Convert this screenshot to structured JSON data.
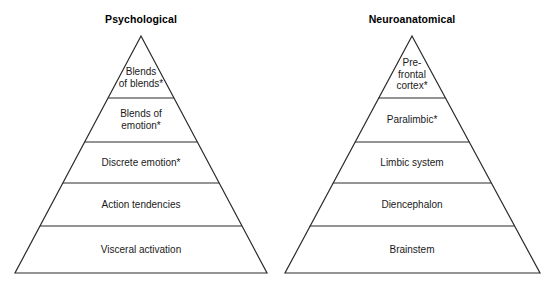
{
  "figure": {
    "background_color": "#ffffff",
    "stroke_color": "#2a2a2a",
    "text_color": "#1a1a1a"
  },
  "pyramids": [
    {
      "id": "psychological",
      "title": "Psychological",
      "apex": {
        "x": 141,
        "y": 36
      },
      "base": {
        "left_x": 15,
        "right_x": 267,
        "y": 273
      },
      "divider_y": [
        98,
        142,
        183,
        226
      ],
      "levels": [
        {
          "index": 0,
          "label": "Blends\nof blends*",
          "center_x": 141,
          "center_y": 77
        },
        {
          "index": 1,
          "label": "Blends of\nemotion*",
          "center_x": 141,
          "center_y": 119
        },
        {
          "index": 2,
          "label": "Discrete emotion*",
          "center_x": 141,
          "center_y": 163
        },
        {
          "index": 3,
          "label": "Action tendencies",
          "center_x": 141,
          "center_y": 205
        },
        {
          "index": 4,
          "label": "Visceral activation",
          "center_x": 141,
          "center_y": 250
        }
      ]
    },
    {
      "id": "neuroanatomical",
      "title": "Neuroanatomical",
      "apex": {
        "x": 412,
        "y": 36
      },
      "base": {
        "left_x": 285,
        "right_x": 540,
        "y": 273
      },
      "divider_y": [
        98,
        142,
        183,
        226
      ],
      "levels": [
        {
          "index": 0,
          "label": "Pre-\nfrontal\ncortex*",
          "center_x": 412,
          "center_y": 74
        },
        {
          "index": 1,
          "label": "Paralimbic*",
          "center_x": 412,
          "center_y": 120
        },
        {
          "index": 2,
          "label": "Limbic system",
          "center_x": 412,
          "center_y": 163
        },
        {
          "index": 3,
          "label": "Diencephalon",
          "center_x": 412,
          "center_y": 205
        },
        {
          "index": 4,
          "label": "Brainstem",
          "center_x": 412,
          "center_y": 250
        }
      ]
    }
  ]
}
